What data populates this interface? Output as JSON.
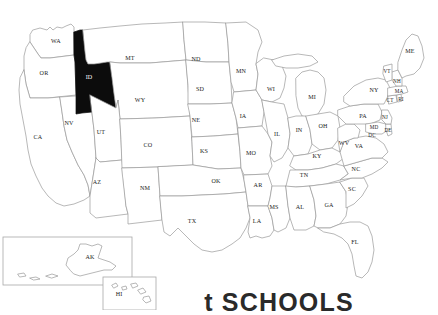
{
  "map": {
    "title": "United States state map",
    "highlighted_state": {
      "code": "ID",
      "name": "Idaho",
      "fill_color": "#0c0c0c"
    },
    "base_fill_color": "#ffffff",
    "border_color": "#9a9a9a",
    "label_color": "#1b1b1b",
    "states": [
      {
        "code": "WA",
        "x": 56,
        "y": 42,
        "highlighted": false
      },
      {
        "code": "OR",
        "x": 44,
        "y": 74,
        "highlighted": false
      },
      {
        "code": "CA",
        "x": 38,
        "y": 138,
        "highlighted": false
      },
      {
        "code": "NV",
        "x": 69,
        "y": 124,
        "highlighted": false
      },
      {
        "code": "ID",
        "x": 89,
        "y": 78,
        "highlighted": true
      },
      {
        "code": "MT",
        "x": 130,
        "y": 59,
        "highlighted": false
      },
      {
        "code": "WY",
        "x": 140,
        "y": 101,
        "highlighted": false
      },
      {
        "code": "UT",
        "x": 101,
        "y": 133,
        "highlighted": false
      },
      {
        "code": "AZ",
        "x": 97,
        "y": 183,
        "highlighted": false
      },
      {
        "code": "CO",
        "x": 148,
        "y": 146,
        "highlighted": false
      },
      {
        "code": "NM",
        "x": 145,
        "y": 189,
        "highlighted": false
      },
      {
        "code": "ND",
        "x": 196,
        "y": 60,
        "highlighted": false
      },
      {
        "code": "SD",
        "x": 200,
        "y": 90,
        "highlighted": false
      },
      {
        "code": "NE",
        "x": 196,
        "y": 121,
        "highlighted": false
      },
      {
        "code": "KS",
        "x": 204,
        "y": 152,
        "highlighted": false
      },
      {
        "code": "OK",
        "x": 216,
        "y": 182,
        "highlighted": false
      },
      {
        "code": "TX",
        "x": 192,
        "y": 222,
        "highlighted": false
      },
      {
        "code": "MN",
        "x": 241,
        "y": 72,
        "highlighted": false
      },
      {
        "code": "IA",
        "x": 243,
        "y": 117,
        "highlighted": false
      },
      {
        "code": "MO",
        "x": 251,
        "y": 154,
        "highlighted": false
      },
      {
        "code": "AR",
        "x": 258,
        "y": 186,
        "highlighted": false
      },
      {
        "code": "LA",
        "x": 257,
        "y": 222,
        "highlighted": false
      },
      {
        "code": "WI",
        "x": 271,
        "y": 90,
        "highlighted": false
      },
      {
        "code": "IL",
        "x": 277,
        "y": 135,
        "highlighted": false
      },
      {
        "code": "MS",
        "x": 274,
        "y": 208,
        "highlighted": false
      },
      {
        "code": "MI",
        "x": 312,
        "y": 98,
        "highlighted": false
      },
      {
        "code": "IN",
        "x": 299,
        "y": 131,
        "highlighted": false
      },
      {
        "code": "OH",
        "x": 323,
        "y": 127,
        "highlighted": false
      },
      {
        "code": "KY",
        "x": 317,
        "y": 157,
        "highlighted": false
      },
      {
        "code": "TN",
        "x": 304,
        "y": 176,
        "highlighted": false
      },
      {
        "code": "AL",
        "x": 300,
        "y": 208,
        "highlighted": false
      },
      {
        "code": "GA",
        "x": 329,
        "y": 206,
        "highlighted": false
      },
      {
        "code": "FL",
        "x": 355,
        "y": 243,
        "highlighted": false
      },
      {
        "code": "SC",
        "x": 352,
        "y": 190,
        "highlighted": false
      },
      {
        "code": "NC",
        "x": 356,
        "y": 170,
        "highlighted": false
      },
      {
        "code": "VA",
        "x": 359,
        "y": 147,
        "highlighted": false
      },
      {
        "code": "WV",
        "x": 344,
        "y": 144,
        "highlighted": false
      },
      {
        "code": "PA",
        "x": 363,
        "y": 117,
        "highlighted": false
      },
      {
        "code": "NY",
        "x": 374,
        "y": 91,
        "highlighted": false
      },
      {
        "code": "MD",
        "x": 374,
        "y": 128,
        "highlighted": false
      },
      {
        "code": "DC",
        "x": 372,
        "y": 136,
        "highlighted": false
      },
      {
        "code": "DE",
        "x": 388,
        "y": 131,
        "highlighted": false
      },
      {
        "code": "NJ",
        "x": 385,
        "y": 118,
        "highlighted": false
      },
      {
        "code": "CT",
        "x": 390,
        "y": 101,
        "highlighted": false
      },
      {
        "code": "RI",
        "x": 401,
        "y": 100,
        "highlighted": false
      },
      {
        "code": "MA",
        "x": 399,
        "y": 92,
        "highlighted": false
      },
      {
        "code": "NH",
        "x": 397,
        "y": 82,
        "highlighted": false
      },
      {
        "code": "VT",
        "x": 387,
        "y": 72,
        "highlighted": false
      },
      {
        "code": "ME",
        "x": 410,
        "y": 52,
        "highlighted": false
      }
    ],
    "insets": [
      {
        "code": "AK",
        "name": "Alaska",
        "label_x": 90,
        "label_y": 258,
        "box": {
          "x": 3,
          "y": 237,
          "width": 129,
          "height": 48
        }
      },
      {
        "code": "HI",
        "name": "Hawaii",
        "label_x": 119,
        "label_y": 295,
        "box": {
          "x": 103,
          "y": 277,
          "width": 53,
          "height": 33
        }
      }
    ]
  },
  "caption": {
    "text": "t SCHOOLS",
    "note": "partially cropped caption at bottom edge"
  }
}
